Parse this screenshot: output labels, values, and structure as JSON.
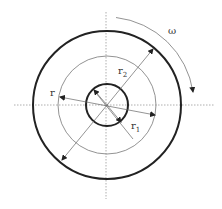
{
  "diagram": {
    "labels": {
      "omega": "ω",
      "r": "r",
      "r1_base": "r",
      "r1_sub": "1",
      "r2_base": "r",
      "r2_sub": "2"
    },
    "geometry": {
      "center": [
        107,
        105
      ],
      "outer_radius": 74,
      "middle_radius": 49,
      "inner_radius": 21,
      "rotation_arc_radius": 88
    },
    "colors": {
      "line": "#222222",
      "thin_line": "#777777",
      "axis": "#999999"
    }
  }
}
